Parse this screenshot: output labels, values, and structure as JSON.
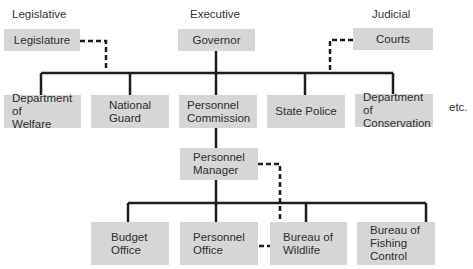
{
  "diagram": {
    "type": "org-chart",
    "branch_headers": [
      {
        "label": "Legislative"
      },
      {
        "label": "Executive"
      },
      {
        "label": "Judicial"
      }
    ],
    "top_row": [
      {
        "label": "Legislature"
      },
      {
        "label": "Governor"
      },
      {
        "label": "Courts"
      }
    ],
    "departments": [
      {
        "label": "Department of\nWelfare"
      },
      {
        "label": "National\nGuard"
      },
      {
        "label": "Personnel\nCommission"
      },
      {
        "label": "State Police"
      },
      {
        "label": "Department of\nConservation"
      }
    ],
    "etc_label": "etc.",
    "manager": {
      "label": "Personnel\nManager"
    },
    "offices": [
      {
        "label": "Budget\nOffice"
      },
      {
        "label": "Personnel\nOffice"
      },
      {
        "label": "Bureau of\nWildlife"
      },
      {
        "label": "Bureau of\nFishing\nControl"
      }
    ],
    "colors": {
      "box_fill": "#d6d6d6",
      "line": "#1e1e1e",
      "text": "#2e2e2e"
    }
  }
}
